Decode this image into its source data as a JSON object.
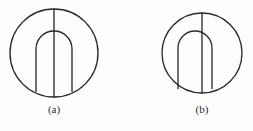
{
  "figure": {
    "title": "",
    "background_color": "#fdfdfc",
    "stroke_color": "#2b2b2b",
    "subfigures": [
      {
        "id": "a",
        "caption": "(a)",
        "description": "circle with vertical diameter and centered inner arch",
        "circle": {
          "cx": 54,
          "cy": 53,
          "r": 44
        },
        "diameter_line": {
          "x": 54,
          "y1": 9,
          "y2": 97
        },
        "arch": {
          "left_x": 36,
          "right_x": 72,
          "top_y": 31,
          "bottom_y": 92,
          "corner_radius": 18,
          "aligned": "centered"
        }
      },
      {
        "id": "b",
        "caption": "(b)",
        "description": "circle with vertical diameter and inner arch offset to the left",
        "circle": {
          "cx": 202,
          "cy": 53,
          "r": 40
        },
        "diameter_line": {
          "x": 202,
          "y1": 13,
          "y2": 93
        },
        "arch": {
          "left_x": 178,
          "right_x": 212,
          "top_y": 31,
          "bottom_y": 89,
          "corner_radius": 17,
          "aligned": "offset-left"
        }
      }
    ]
  }
}
